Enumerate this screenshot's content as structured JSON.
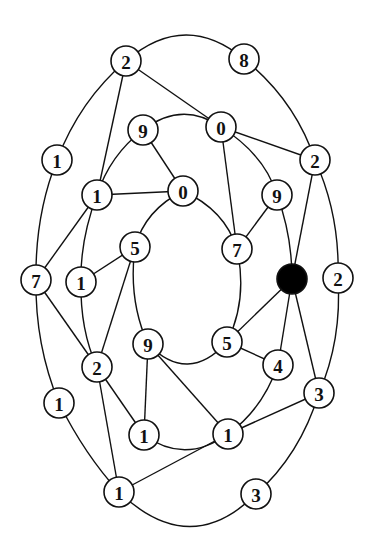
{
  "diagram": {
    "type": "graph",
    "node_radius": 15,
    "colors": {
      "stroke": "#111111",
      "fill": "#ffffff",
      "highlight": "#000000"
    },
    "nodes": [
      {
        "id": "A",
        "label": "2",
        "x": 126,
        "y": 61
      },
      {
        "id": "B",
        "label": "8",
        "x": 244,
        "y": 59
      },
      {
        "id": "C",
        "label": "1",
        "x": 57,
        "y": 160
      },
      {
        "id": "D",
        "label": "9",
        "x": 143,
        "y": 130
      },
      {
        "id": "E",
        "label": "0",
        "x": 221,
        "y": 127
      },
      {
        "id": "F",
        "label": "2",
        "x": 315,
        "y": 160
      },
      {
        "id": "G",
        "label": "1",
        "x": 97,
        "y": 195
      },
      {
        "id": "H",
        "label": "0",
        "x": 183,
        "y": 191
      },
      {
        "id": "I",
        "label": "9",
        "x": 277,
        "y": 195
      },
      {
        "id": "J",
        "label": "5",
        "x": 135,
        "y": 247
      },
      {
        "id": "K",
        "label": "7",
        "x": 237,
        "y": 249
      },
      {
        "id": "L",
        "label": "",
        "x": 292,
        "y": 279,
        "filled": true
      },
      {
        "id": "M",
        "label": "2",
        "x": 338,
        "y": 278
      },
      {
        "id": "N",
        "label": "7",
        "x": 36,
        "y": 280
      },
      {
        "id": "O",
        "label": "1",
        "x": 81,
        "y": 282
      },
      {
        "id": "P",
        "label": "9",
        "x": 148,
        "y": 344
      },
      {
        "id": "Q",
        "label": "5",
        "x": 227,
        "y": 342
      },
      {
        "id": "R",
        "label": "4",
        "x": 278,
        "y": 365
      },
      {
        "id": "S",
        "label": "2",
        "x": 97,
        "y": 367
      },
      {
        "id": "T",
        "label": "3",
        "x": 319,
        "y": 393
      },
      {
        "id": "U",
        "label": "1",
        "x": 59,
        "y": 403
      },
      {
        "id": "V",
        "label": "1",
        "x": 144,
        "y": 435
      },
      {
        "id": "W",
        "label": "1",
        "x": 228,
        "y": 434
      },
      {
        "id": "X",
        "label": "1",
        "x": 119,
        "y": 492
      },
      {
        "id": "Y",
        "label": "3",
        "x": 256,
        "y": 494
      }
    ],
    "edges": [
      {
        "d": "M 126 61 Q 185 10 244 59"
      },
      {
        "d": "M 126 61 Q 80 100 57 160"
      },
      {
        "d": "M 126 61 L 97 195"
      },
      {
        "d": "M 126 61 L 221 127"
      },
      {
        "d": "M 244 59 Q 295 100 315 160"
      },
      {
        "d": "M 143 130 Q 182 100 221 127"
      },
      {
        "d": "M 143 130 Q 110 155 97 195"
      },
      {
        "d": "M 143 130 L 183 191"
      },
      {
        "d": "M 221 127 L 315 160"
      },
      {
        "d": "M 221 127 L 237 249"
      },
      {
        "d": "M 221 127 Q 265 155 277 195"
      },
      {
        "d": "M 97 195 L 183 191"
      },
      {
        "d": "M 183 191 Q 145 210 135 247"
      },
      {
        "d": "M 183 191 Q 225 210 237 249"
      },
      {
        "d": "M 97 195 L 36 280"
      },
      {
        "d": "M 97 195 Q 80 240 81 282"
      },
      {
        "d": "M 57 160 Q 35 215 36 280"
      },
      {
        "d": "M 277 195 L 237 249"
      },
      {
        "d": "M 277 195 Q 292 235 292 279"
      },
      {
        "d": "M 315 160 L 292 279"
      },
      {
        "d": "M 315 160 Q 340 215 338 278"
      },
      {
        "d": "M 135 247 L 81 282"
      },
      {
        "d": "M 135 247 L 97 367"
      },
      {
        "d": "M 135 247 Q 128 300 148 344"
      },
      {
        "d": "M 237 249 Q 248 300 227 342"
      },
      {
        "d": "M 36 280 L 97 367"
      },
      {
        "d": "M 81 282 Q 80 330 97 367"
      },
      {
        "d": "M 36 280 Q 35 345 59 403"
      },
      {
        "d": "M 292 279 L 227 342"
      },
      {
        "d": "M 292 279 L 278 365"
      },
      {
        "d": "M 292 279 L 319 393"
      },
      {
        "d": "M 338 278 Q 342 340 319 393"
      },
      {
        "d": "M 148 344 Q 188 385 227 342"
      },
      {
        "d": "M 227 342 L 278 365"
      },
      {
        "d": "M 148 344 L 144 435"
      },
      {
        "d": "M 148 344 L 228 434"
      },
      {
        "d": "M 97 367 L 144 435"
      },
      {
        "d": "M 97 367 L 119 492"
      },
      {
        "d": "M 278 365 Q 262 410 228 434"
      },
      {
        "d": "M 319 393 L 228 434"
      },
      {
        "d": "M 319 393 Q 300 455 256 494"
      },
      {
        "d": "M 144 435 Q 185 465 228 434"
      },
      {
        "d": "M 228 434 L 119 492"
      },
      {
        "d": "M 59 403 Q 85 455 119 492"
      },
      {
        "d": "M 119 492 Q 190 560 256 494"
      }
    ]
  }
}
